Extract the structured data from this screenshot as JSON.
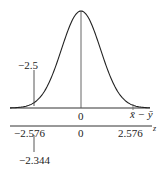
{
  "chart_data": {
    "type": "line",
    "title": "",
    "curve": {
      "shape": "normal",
      "mean": 0,
      "sd": 1
    },
    "upper_axis": {
      "label": "x̄ − ȳ",
      "ticks": [
        "0"
      ],
      "annotations": [
        {
          "label": "−2.5",
          "x_z": -2.344
        }
      ]
    },
    "lower_axis": {
      "label": "z",
      "ticks": [
        "−2.576",
        "0",
        "2.576"
      ],
      "annotations": [
        {
          "label": "−2.344",
          "x_z": -2.344
        }
      ]
    },
    "xlim": [
      -3.2,
      3.2
    ]
  },
  "labels": {
    "upper_annot": "−2.5",
    "upper_zero": "0",
    "upper_axis_label": "x̄ − ȳ",
    "lower_left": "−2.576",
    "lower_zero": "0",
    "lower_right": "2.576",
    "lower_axis_label": "z",
    "lower_annot": "−2.344"
  }
}
